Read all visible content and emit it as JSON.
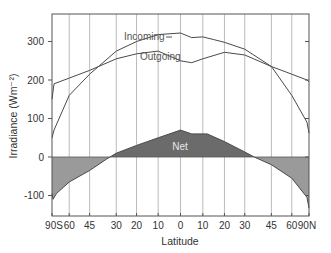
{
  "chart_data": {
    "type": "line",
    "title": "",
    "xlabel": "Latitude",
    "ylabel": "Irradiance (Wm⁻²)",
    "x_scale": "sine of latitude",
    "xlim": [
      -90,
      90
    ],
    "ylim": [
      -150,
      375
    ],
    "x_ticks": [
      {
        "value": -90,
        "label": "90S"
      },
      {
        "value": -60,
        "label": "60"
      },
      {
        "value": -45,
        "label": "45"
      },
      {
        "value": -30,
        "label": "30"
      },
      {
        "value": -20,
        "label": "20"
      },
      {
        "value": -10,
        "label": "10"
      },
      {
        "value": 0,
        "label": "0"
      },
      {
        "value": 10,
        "label": "10"
      },
      {
        "value": 20,
        "label": "20"
      },
      {
        "value": 30,
        "label": "30"
      },
      {
        "value": 45,
        "label": "45"
      },
      {
        "value": 60,
        "label": "60"
      },
      {
        "value": 90,
        "label": "90N"
      }
    ],
    "y_ticks": [
      -100,
      0,
      100,
      200,
      300
    ],
    "grid": {
      "vertical": true,
      "horizontal": false
    },
    "series": [
      {
        "name": "Incoming",
        "x": [
          -90,
          -80,
          -60,
          -45,
          -30,
          -20,
          -10,
          0,
          5,
          10,
          15,
          20,
          30,
          45,
          60,
          80,
          90
        ],
        "values": [
          50,
          70,
          160,
          215,
          275,
          300,
          318,
          322,
          310,
          312,
          305,
          298,
          280,
          235,
          160,
          90,
          62
        ]
      },
      {
        "name": "Outgoing",
        "x": [
          -90,
          -80,
          -60,
          -45,
          -30,
          -20,
          -10,
          0,
          5,
          10,
          20,
          30,
          45,
          60,
          80,
          90
        ],
        "values": [
          150,
          190,
          205,
          225,
          255,
          268,
          275,
          250,
          245,
          255,
          272,
          265,
          235,
          215,
          200,
          195
        ]
      },
      {
        "name": "Net",
        "x": [
          -90,
          -83,
          -75,
          -60,
          -45,
          -35,
          -30,
          -20,
          -10,
          0,
          5,
          12,
          20,
          30,
          35,
          45,
          60,
          80,
          90
        ],
        "values": [
          -95,
          -110,
          -95,
          -65,
          -35,
          -5,
          10,
          30,
          50,
          70,
          60,
          60,
          40,
          13,
          0,
          -20,
          -55,
          -105,
          -133
        ]
      }
    ],
    "annotations": [
      "Incoming",
      "Outgoing",
      "Net"
    ],
    "colors": {
      "lines": "#555555",
      "net_positive_fill": "#6b6b6b",
      "net_negative_fill": "#9a9a9a",
      "grid": "#bbbbbb",
      "frame": "#555555"
    }
  }
}
